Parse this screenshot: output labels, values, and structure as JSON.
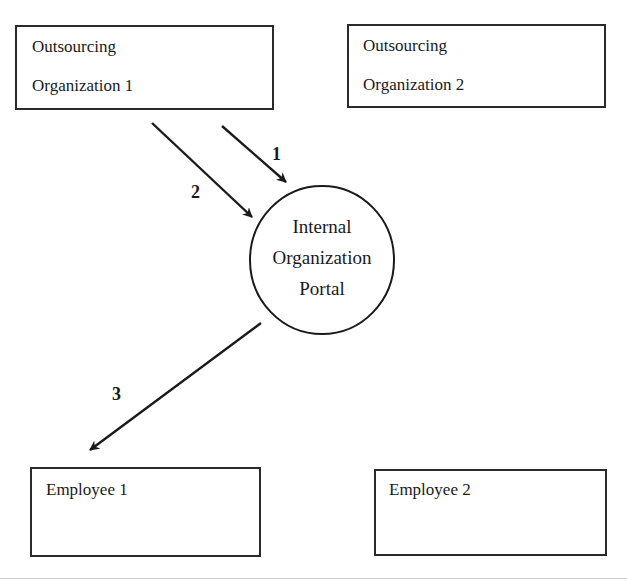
{
  "diagram": {
    "nodes": {
      "outsourcing_org_1": {
        "lines": [
          "Outsourcing",
          "Organization 1"
        ]
      },
      "outsourcing_org_2": {
        "lines": [
          "Outsourcing",
          "Organization 2"
        ]
      },
      "portal": {
        "lines": [
          "Internal",
          "Organization",
          "Portal"
        ]
      },
      "employee_1": {
        "label": "Employee 1"
      },
      "employee_2": {
        "label": "Employee 2"
      }
    },
    "edges": [
      {
        "step": "1",
        "from": "Outsourcing Organization 1",
        "to": "Internal Organization Portal"
      },
      {
        "step": "2",
        "from": "Outsourcing Organization 1",
        "to": "Internal Organization Portal"
      },
      {
        "step": "3",
        "from": "Internal Organization Portal",
        "to": "Employee 1"
      }
    ],
    "colors": {
      "stroke": "#1a1a1a",
      "background": "#ffffff"
    }
  }
}
